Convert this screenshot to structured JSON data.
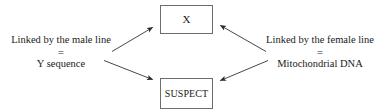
{
  "diagram": {
    "stroke_color": "#333333",
    "box_border_color": "#6d6d6d",
    "background": "#ffffff",
    "nodes": [
      {
        "id": "x",
        "label": "X",
        "name": "unknown-person-box"
      },
      {
        "id": "suspect",
        "label": "SUSPECT",
        "name": "suspect-box"
      }
    ],
    "left_block": {
      "line1": "Linked by the male line",
      "equals": "=",
      "line2": "Y sequence"
    },
    "right_block": {
      "line1": "Linked by the female line",
      "equals": "=",
      "line2": "Mitochondrial DNA"
    },
    "arrows": [
      {
        "id": "male-to-x",
        "from": "left-block",
        "to": "x",
        "direction": "up-right"
      },
      {
        "id": "male-to-suspect",
        "from": "left-block",
        "to": "suspect",
        "direction": "down-right"
      },
      {
        "id": "female-to-x",
        "from": "right-block",
        "to": "x",
        "direction": "up-left"
      },
      {
        "id": "female-to-suspect",
        "from": "right-block",
        "to": "suspect",
        "direction": "down-left"
      }
    ]
  }
}
